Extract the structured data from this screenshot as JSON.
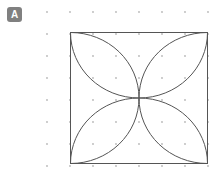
{
  "figure": {
    "label": {
      "text": "A",
      "badge_color": "#808080",
      "text_color": "#ffffff",
      "x": 7,
      "y": 7,
      "width": 15,
      "height": 15,
      "font_size": 10
    },
    "canvas": {
      "width": 217,
      "height": 174,
      "background": "#ffffff"
    },
    "dot_grid": {
      "color": "#b8b8b8",
      "radius": 0.9,
      "origin_x": 47,
      "origin_y": 12,
      "spacing_x": 23,
      "spacing_y": 22,
      "cols": 8,
      "rows": 8
    },
    "square": {
      "x": 70,
      "y": 32,
      "width": 138,
      "height": 132,
      "stroke": "#555555",
      "stroke_width": 1,
      "fill": "none"
    },
    "petals": {
      "description": "four-petal rosette formed by four inward semicircular arcs, one centered on each side midpoint, each with radius equal to half the square side",
      "stroke": "#555555",
      "stroke_width": 1,
      "fill": "none",
      "center_x": 139,
      "center_y": 98,
      "arc_radius_x": 69,
      "arc_radius_y": 66,
      "arc_count": 4
    }
  }
}
